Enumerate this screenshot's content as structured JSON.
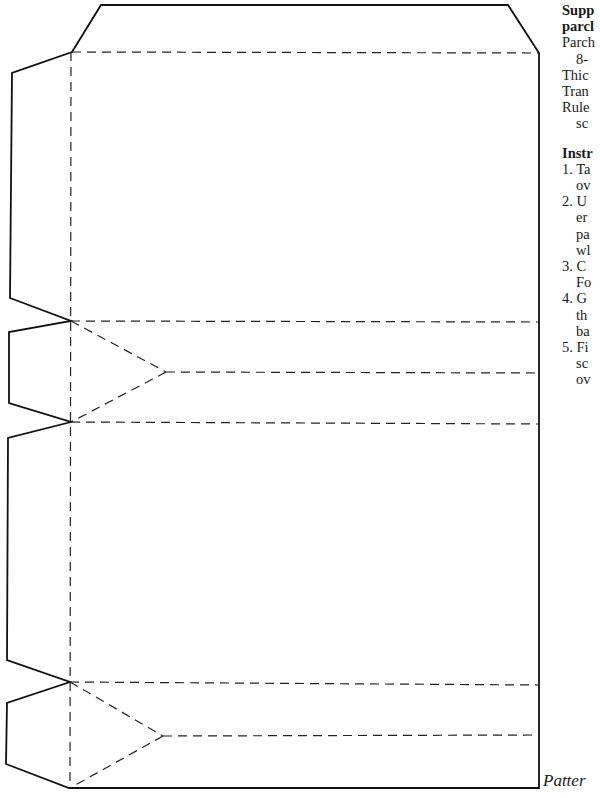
{
  "page": {
    "type": "craft pattern template page"
  },
  "pattern": {
    "cut_line_color": "#111111",
    "fold_line_color": "#222222",
    "outline_points": [
      [
        101,
        5
      ],
      [
        508,
        5
      ],
      [
        539,
        53
      ],
      [
        539,
        788
      ],
      [
        69,
        788
      ],
      [
        6,
        764
      ],
      [
        7,
        703
      ],
      [
        70,
        682
      ],
      [
        7,
        660
      ],
      [
        8,
        438
      ],
      [
        71,
        422
      ],
      [
        9,
        403
      ],
      [
        9,
        332
      ],
      [
        71,
        321
      ],
      [
        10,
        298
      ],
      [
        12,
        73
      ],
      [
        72,
        52
      ]
    ],
    "fold_lines": [
      {
        "from": [
          72,
          52
        ],
        "to": [
          539,
          53
        ]
      },
      {
        "from": [
          71,
          52
        ],
        "to": [
          70,
          788
        ]
      },
      {
        "from": [
          71,
          321
        ],
        "to": [
          539,
          322
        ]
      },
      {
        "from": [
          71,
          321
        ],
        "to": [
          166,
          372
        ]
      },
      {
        "from": [
          166,
          372
        ],
        "to": [
          539,
          373
        ]
      },
      {
        "from": [
          166,
          372
        ],
        "to": [
          71,
          422
        ]
      },
      {
        "from": [
          71,
          422
        ],
        "to": [
          539,
          424
        ]
      },
      {
        "from": [
          70,
          682
        ],
        "to": [
          539,
          685
        ]
      },
      {
        "from": [
          70,
          682
        ],
        "to": [
          163,
          736
        ]
      },
      {
        "from": [
          163,
          736
        ],
        "to": [
          539,
          735
        ]
      },
      {
        "from": [
          163,
          736
        ],
        "to": [
          70,
          788
        ]
      }
    ]
  },
  "supplies": {
    "title_line1": "Supp",
    "title_line2": "parcl",
    "items": [
      {
        "text": "Parch",
        "indent": false
      },
      {
        "text": "8-",
        "indent": true
      },
      {
        "text": "Thic",
        "indent": false
      },
      {
        "text": "Tran",
        "indent": false
      },
      {
        "text": "Rule",
        "indent": false
      },
      {
        "text": "sc",
        "indent": true
      }
    ]
  },
  "instructions": {
    "title": "Instr",
    "steps": [
      {
        "num": "1.",
        "lines": [
          "Ta",
          "ov"
        ]
      },
      {
        "num": "2.",
        "lines": [
          "U",
          "er",
          "pa",
          "wl"
        ]
      },
      {
        "num": "3.",
        "lines": [
          "C",
          "Fo"
        ]
      },
      {
        "num": "4.",
        "lines": [
          "G",
          "th",
          "ba"
        ]
      },
      {
        "num": "5.",
        "lines": [
          "Fi",
          "sc",
          "ov"
        ]
      }
    ]
  },
  "caption": {
    "text": "Patter"
  }
}
